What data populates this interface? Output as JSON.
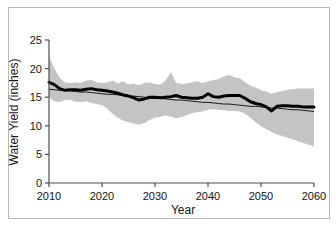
{
  "chart_data": {
    "type": "line",
    "title": "",
    "xlabel": "Year",
    "ylabel": "Water Yield (inches)",
    "xlim": [
      2010,
      2060
    ],
    "ylim": [
      0,
      25
    ],
    "xticks": [
      2010,
      2020,
      2030,
      2040,
      2050,
      2060
    ],
    "yticks": [
      0,
      5,
      10,
      15,
      20,
      25
    ],
    "grid": false,
    "legend": "none",
    "colors": {
      "band": "#c4c4c4",
      "data_line": "#000000",
      "trend_line": "#1a1a1a",
      "axis": "#4d4d4d",
      "background": "#ffffff"
    },
    "x": [
      2010,
      2011,
      2012,
      2013,
      2014,
      2015,
      2016,
      2017,
      2018,
      2019,
      2020,
      2021,
      2022,
      2023,
      2024,
      2025,
      2026,
      2027,
      2028,
      2029,
      2030,
      2031,
      2032,
      2033,
      2034,
      2035,
      2036,
      2037,
      2038,
      2039,
      2040,
      2041,
      2042,
      2043,
      2044,
      2045,
      2046,
      2047,
      2048,
      2049,
      2050,
      2051,
      2052,
      2053,
      2054,
      2055,
      2056,
      2057,
      2058,
      2059,
      2060
    ],
    "series": [
      {
        "name": "Water yield (median projection)",
        "style": "thick-black-line",
        "values": [
          17.6,
          17.2,
          16.5,
          16.2,
          16.3,
          16.3,
          16.2,
          16.4,
          16.5,
          16.3,
          16.2,
          16.1,
          15.9,
          15.7,
          15.4,
          15.2,
          14.9,
          14.5,
          14.7,
          15.0,
          15.0,
          14.9,
          15.0,
          15.1,
          15.3,
          15.0,
          14.9,
          14.8,
          14.8,
          15.0,
          15.6,
          15.1,
          15.0,
          15.2,
          15.3,
          15.3,
          15.3,
          14.8,
          14.2,
          13.9,
          13.7,
          13.3,
          12.6,
          13.4,
          13.5,
          13.5,
          13.4,
          13.4,
          13.3,
          13.3,
          13.3
        ]
      },
      {
        "name": "Linear trend",
        "style": "thin-black-line",
        "values": [
          16.4,
          16.3,
          16.2,
          16.2,
          16.1,
          16.0,
          15.9,
          15.9,
          15.8,
          15.7,
          15.6,
          15.5,
          15.5,
          15.4,
          15.3,
          15.2,
          15.2,
          15.1,
          15.0,
          14.9,
          14.8,
          14.8,
          14.7,
          14.6,
          14.5,
          14.5,
          14.4,
          14.3,
          14.2,
          14.1,
          14.1,
          14.0,
          13.9,
          13.8,
          13.8,
          13.7,
          13.6,
          13.5,
          13.4,
          13.4,
          13.3,
          13.2,
          13.1,
          13.1,
          13.0,
          12.9,
          12.8,
          12.8,
          12.7,
          12.6,
          12.5
        ]
      }
    ],
    "band": {
      "name": "Projection uncertainty range",
      "upper": [
        22.1,
        20.0,
        18.4,
        17.6,
        17.5,
        17.6,
        17.5,
        17.9,
        18.0,
        17.6,
        17.5,
        17.6,
        17.9,
        17.4,
        17.8,
        17.2,
        17.4,
        17.1,
        17.5,
        17.6,
        17.3,
        17.2,
        17.9,
        19.4,
        17.5,
        17.3,
        17.4,
        17.6,
        17.8,
        17.5,
        17.8,
        18.0,
        18.2,
        18.6,
        18.9,
        18.5,
        18.3,
        17.6,
        17.0,
        16.7,
        16.2,
        16.0,
        15.6,
        15.9,
        16.1,
        16.3,
        16.4,
        16.5,
        16.5,
        16.5,
        16.5
      ],
      "lower": [
        15.0,
        14.3,
        14.1,
        14.5,
        14.5,
        14.2,
        14.1,
        14.3,
        14.0,
        13.8,
        13.6,
        13.0,
        12.1,
        11.4,
        10.9,
        10.6,
        10.4,
        10.2,
        10.5,
        11.0,
        11.4,
        11.6,
        11.8,
        11.6,
        11.3,
        11.5,
        11.9,
        12.2,
        12.4,
        12.5,
        12.8,
        12.9,
        12.8,
        12.7,
        12.6,
        12.6,
        12.5,
        12.1,
        11.4,
        10.6,
        9.9,
        9.4,
        8.9,
        8.5,
        8.2,
        7.9,
        7.6,
        7.3,
        7.0,
        6.7,
        6.4
      ]
    }
  }
}
